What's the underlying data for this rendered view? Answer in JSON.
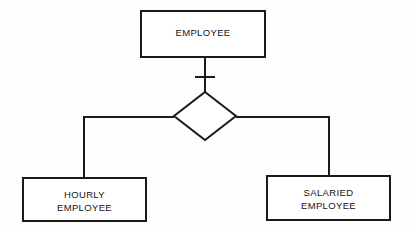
{
  "diagram": {
    "kind": "entity-relationship-diagram",
    "title": "",
    "background_color": "#fefefe",
    "stroke_color": "#1a1a1a",
    "fill_color": "#ffffff",
    "entities": [
      {
        "id": "employee",
        "label": "EMPLOYEE",
        "role": "supertype",
        "shape": "rectangle",
        "x": 141,
        "y": 11,
        "width": 124,
        "height": 46
      },
      {
        "id": "hourly_employee",
        "label": "HOURLY\nEMPLOYEE",
        "role": "subtype",
        "shape": "rectangle",
        "x": 23,
        "y": 178,
        "width": 123,
        "height": 43
      },
      {
        "id": "salaried_employee",
        "label": "SALARIED\nEMPLOYEE",
        "role": "subtype",
        "shape": "rectangle",
        "x": 267,
        "y": 176,
        "width": 123,
        "height": 44
      }
    ],
    "relationship": {
      "id": "specialization_diamond",
      "label": "",
      "shape": "diamond",
      "center_x": 205,
      "center_y": 116,
      "half_width": 31,
      "half_height": 24
    },
    "connectors": [
      {
        "id": "employee-to-diamond",
        "from": "employee",
        "to": "specialization_diamond",
        "cardinality_marker": "one",
        "marker_x": 205,
        "marker_y": 77,
        "marker_half_width": 10
      },
      {
        "id": "diamond-to-hourly",
        "from": "specialization_diamond",
        "to": "hourly_employee",
        "elbow_x": 84,
        "elbow_y": 117
      },
      {
        "id": "diamond-to-salaried",
        "from": "specialization_diamond",
        "to": "salaried_employee",
        "elbow_x": 329,
        "elbow_y": 117
      }
    ]
  }
}
